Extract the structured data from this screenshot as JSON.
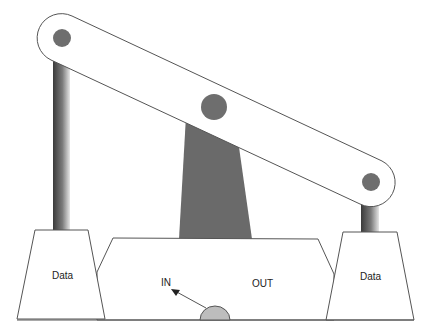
{
  "diagram": {
    "type": "mechanical linkage / pump-jack schematic",
    "labels": {
      "left_block": "Data",
      "right_block": "Data",
      "in": "IN",
      "out": "OUT"
    },
    "components": {
      "beam": "rounded beam linking three pivots",
      "pivots": [
        "left-pivot",
        "center-pivot",
        "right-pivot"
      ],
      "left_post": "gradient post",
      "right_post": "gradient post",
      "center_pillar": "dark trapezoid support",
      "left_block": "trapezoid block",
      "right_block": "trapezoid block",
      "center_base": "base housing",
      "dome": "half-circle at base",
      "arrow": "arrow pointing toward IN"
    },
    "colors": {
      "stroke": "#555555",
      "pivot_fill": "#6e6e6e",
      "pillar_fill": "#6a6a6a",
      "dome_fill": "#bdbdbd",
      "post_dark": "#3c3c3c",
      "post_light": "#e0e0e0"
    }
  }
}
